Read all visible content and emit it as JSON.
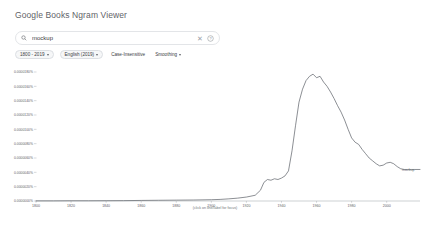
{
  "header": {
    "title": "Google Books Ngram Viewer"
  },
  "search": {
    "value": "mockup",
    "placeholder": "",
    "search_icon": "search-icon",
    "clear_icon": "close-icon",
    "help_icon": "help-circle-icon"
  },
  "controls": {
    "year_range": "1800 - 2019",
    "corpus": "English (2019)",
    "case_insensitive": "Case-Insensitive",
    "smoothing": "Smoothing"
  },
  "chart_data": {
    "type": "line",
    "title": "",
    "xlabel": "",
    "ylabel": "",
    "caption": "(click on line/label for focus)",
    "series_label": "mockup",
    "xlim": [
      1800,
      2019
    ],
    "ylim": [
      0,
      1.8e-05
    ],
    "grid": false,
    "legend": "inline-right",
    "xticks": [
      1800,
      1820,
      1840,
      1860,
      1880,
      1900,
      1920,
      1940,
      1960,
      1980,
      2000
    ],
    "yticks": [
      "0.0000180%",
      "0.0000160%",
      "0.0000140%",
      "0.0000120%",
      "0.0000100%",
      "0.0000080%",
      "0.0000060%",
      "0.0000040%",
      "0.0000020%",
      "0.0000000%"
    ],
    "x": [
      1800,
      1810,
      1820,
      1830,
      1840,
      1850,
      1860,
      1870,
      1880,
      1890,
      1900,
      1905,
      1910,
      1915,
      1920,
      1925,
      1928,
      1930,
      1932,
      1934,
      1936,
      1938,
      1940,
      1942,
      1944,
      1946,
      1948,
      1950,
      1952,
      1954,
      1956,
      1958,
      1960,
      1962,
      1964,
      1966,
      1968,
      1970,
      1972,
      1974,
      1976,
      1978,
      1980,
      1982,
      1984,
      1986,
      1988,
      1990,
      1992,
      1994,
      1996,
      1998,
      2000,
      2002,
      2004,
      2006,
      2008,
      2010,
      2012,
      2014,
      2016,
      2019
    ],
    "values": [
      2e-08,
      2e-08,
      3e-08,
      3e-08,
      4e-08,
      5e-08,
      8e-08,
      1e-07,
      1.2e-07,
      1.4e-07,
      1.8e-07,
      2.2e-07,
      3e-07,
      4e-07,
      5.5e-07,
      8e-07,
      1.5e-06,
      2.6e-06,
      3e-06,
      2.9e-06,
      3.1e-06,
      3e-06,
      3.2e-06,
      3.5e-06,
      4.2e-06,
      7e-06,
      1.05e-05,
      1.38e-05,
      1.56e-05,
      1.68e-05,
      1.74e-05,
      1.77e-05,
      1.72e-05,
      1.74e-05,
      1.66e-05,
      1.6e-05,
      1.52e-05,
      1.43e-05,
      1.33e-05,
      1.24e-05,
      1.13e-05,
      1e-05,
      8.8e-06,
      8.2e-06,
      7.9e-06,
      7.2e-06,
      6.6e-06,
      6e-06,
      5.6e-06,
      5.2e-06,
      4.9e-06,
      5e-06,
      5.3e-06,
      5.4e-06,
      5.2e-06,
      4.8e-06,
      4.5e-06,
      4.4e-06,
      4.4e-06,
      4.4e-06,
      4.4e-06,
      4.4e-06
    ]
  }
}
